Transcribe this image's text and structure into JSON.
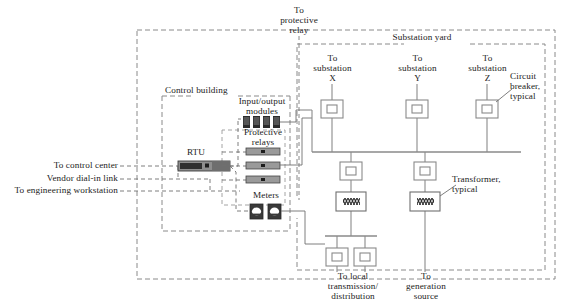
{
  "diagram": {
    "title_hidden": "Substation automation one-line diagram",
    "frame": {
      "style": "dashed-outer-boundary"
    },
    "regions": [
      {
        "id": "substation-yard",
        "label": "Substation yard"
      },
      {
        "id": "control-building",
        "label": "Control building"
      }
    ],
    "labels": {
      "to_protective_relay": "To\nprotective\nrelay",
      "substation_yard": "Substation yard",
      "control_building": "Control building",
      "to_substation_x": "To\nsubstation\nX",
      "to_substation_y": "To\nsubstation\nY",
      "to_substation_z": "To\nsubstation\nZ",
      "circuit_breaker_typical": "Circuit\nbreaker,\ntypical",
      "transformer_typical": "Transformer,\ntypical",
      "input_output_modules": "Input/output\nmodules",
      "protective_relays": "Protective\nrelays",
      "meters": "Meters",
      "rtu": "RTU",
      "to_control_center": "To control center",
      "vendor_dial_in_link": "Vendor dial-in link",
      "to_engineering_workstation": "To engineering workstation",
      "to_local_transmission_distribution": "To local\ntransmission/\ndistribution",
      "to_generation_source": "To\ngeneration\nsource"
    },
    "components": {
      "rtu": {
        "name": "RTU",
        "kind": "remote-terminal-unit"
      },
      "io_modules": {
        "count": 4,
        "kind": "io-module"
      },
      "protective_relays": {
        "count": 3,
        "kind": "protective-relay"
      },
      "meters": {
        "count": 2,
        "kind": "meter"
      },
      "circuit_breakers": {
        "count": 7,
        "kind": "circuit-breaker"
      },
      "transformers": {
        "count": 2,
        "kind": "transformer"
      }
    },
    "colors": {
      "line": "#8a8a8a",
      "line_dark": "#4a4a4a",
      "text": "#1b1b1b",
      "device_dark": "#3a3a3a",
      "device_gray": "#9a9a9a",
      "background": "#ffffff"
    }
  }
}
